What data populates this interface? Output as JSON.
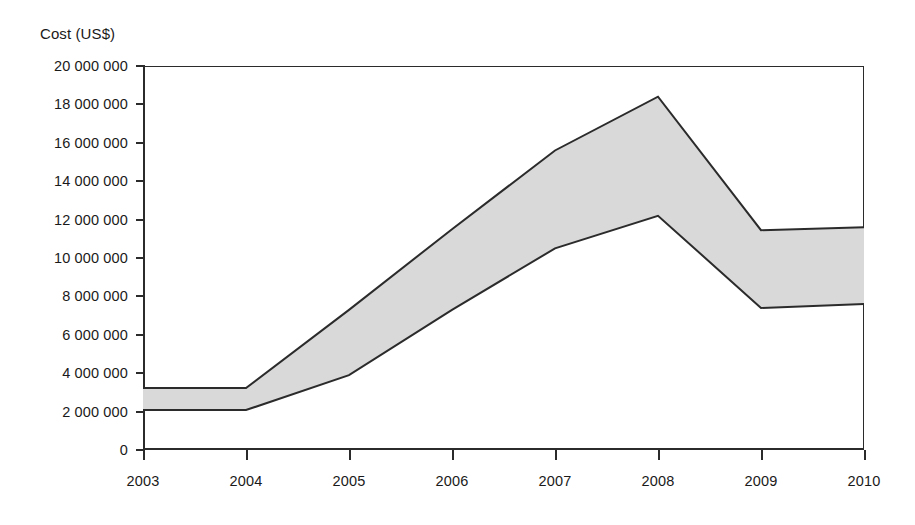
{
  "chart_data": {
    "type": "area",
    "title": "",
    "ylabel": "Cost (US$)",
    "xlabel": "",
    "x": [
      2003,
      2004,
      2005,
      2006,
      2007,
      2008,
      2009,
      2010
    ],
    "categories": [
      "2003",
      "2004",
      "2005",
      "2006",
      "2007",
      "2008",
      "2009",
      "2010"
    ],
    "series": [
      {
        "name": "Upper bound",
        "values": [
          3230000,
          3230000,
          7300000,
          11500000,
          15600000,
          18400000,
          11450000,
          11600000
        ]
      },
      {
        "name": "Lower bound",
        "values": [
          2080000,
          2080000,
          3900000,
          7300000,
          10500000,
          12200000,
          7400000,
          7600000
        ]
      }
    ],
    "band_fill": "#d9d9d9",
    "band_stroke": "#2b2b2b",
    "ylim": [
      0,
      20000000
    ],
    "xlim": [
      2003,
      2010
    ],
    "ytick_values": [
      0,
      2000000,
      4000000,
      6000000,
      8000000,
      10000000,
      12000000,
      14000000,
      16000000,
      18000000,
      20000000
    ],
    "ytick_labels": [
      "0",
      "2 000 000",
      "4 000 000",
      "6 000 000",
      "8 000 000",
      "10 000 000",
      "12 000 000",
      "14 000 000",
      "16 000 000",
      "18 000 000",
      "20 000 000"
    ],
    "grid": false,
    "legend": null,
    "legend_position": "none",
    "annotations": []
  },
  "axis": {
    "y_title": "Cost (US$)"
  },
  "colors": {
    "axis": "#2b2b2b",
    "text": "#1a1a1a",
    "band_fill": "#d9d9d9",
    "band_stroke": "#2b2b2b",
    "background": "#ffffff"
  }
}
